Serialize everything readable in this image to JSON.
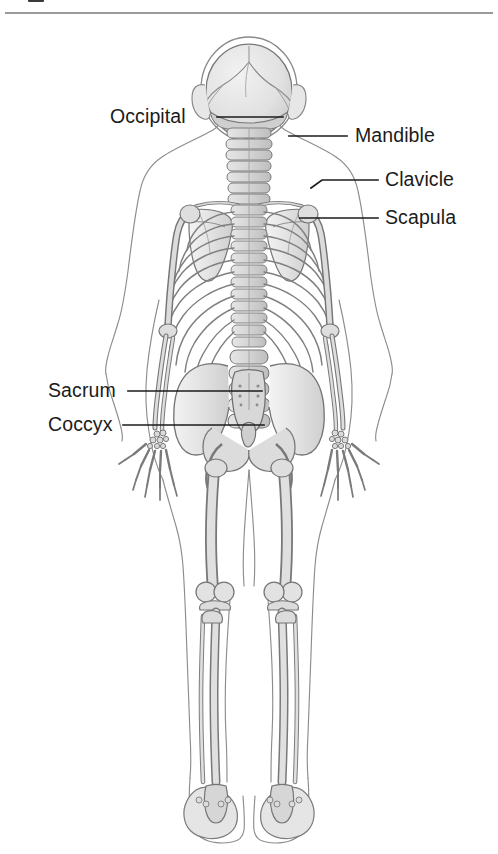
{
  "figure": {
    "title_fragment": "",
    "view": "posterior",
    "background_color": "#ffffff",
    "bone_fill_light": "#ebebeb",
    "bone_fill_mid": "#d2d2d2",
    "bone_fill_dark": "#bdbdbd",
    "outline_color": "#6e6e6e",
    "body_outline_color": "#8d8d8d",
    "label_color": "#1b1b1b",
    "leader_color": "#1b1b1b",
    "rule_color": "#9a9a9a"
  },
  "labels": [
    {
      "id": "occipital",
      "text": "Occipital",
      "side": "left",
      "x": 110,
      "y": 107,
      "leader_from_x": 217,
      "leader_from_y": 117,
      "leader_to_x": 283,
      "leader_to_y": 117
    },
    {
      "id": "mandible",
      "text": "Mandible",
      "side": "right",
      "x": 355,
      "y": 126,
      "leader_from_x": 347,
      "leader_from_y": 136,
      "leader_to_x": 289,
      "leader_to_y": 136
    },
    {
      "id": "clavicle",
      "text": "Clavicle",
      "side": "right",
      "x": 385,
      "y": 170,
      "leader_from_x": 378,
      "leader_from_y": 180,
      "leader_to_x": 318,
      "leader_to_y": 180
    },
    {
      "id": "scapula",
      "text": "Scapula",
      "side": "right",
      "x": 385,
      "y": 208,
      "leader_from_x": 378,
      "leader_from_y": 218,
      "leader_to_x": 318,
      "leader_to_y": 218
    },
    {
      "id": "sacrum",
      "text": "Sacrum",
      "side": "left",
      "x": 48,
      "y": 381,
      "leader_from_x": 128,
      "leader_from_y": 391,
      "leader_to_x": 262,
      "leader_to_y": 391
    },
    {
      "id": "coccyx",
      "text": "Coccyx",
      "side": "left",
      "x": 48,
      "y": 415,
      "leader_from_x": 123,
      "leader_from_y": 425,
      "leader_to_x": 264,
      "leader_to_y": 425
    }
  ],
  "regions": [
    {
      "id": "skull",
      "name": "Skull (occipital view)"
    },
    {
      "id": "cervical-spine",
      "name": "Cervical vertebrae"
    },
    {
      "id": "thoracic-spine",
      "name": "Thoracic vertebrae"
    },
    {
      "id": "lumbar-spine",
      "name": "Lumbar vertebrae"
    },
    {
      "id": "rib-cage",
      "name": "Rib cage"
    },
    {
      "id": "scapula-left",
      "name": "Left scapula"
    },
    {
      "id": "scapula-right",
      "name": "Right scapula"
    },
    {
      "id": "clavicle-left",
      "name": "Left clavicle"
    },
    {
      "id": "clavicle-right",
      "name": "Right clavicle"
    },
    {
      "id": "humerus-left",
      "name": "Left humerus"
    },
    {
      "id": "humerus-right",
      "name": "Right humerus"
    },
    {
      "id": "radius-ulna-left",
      "name": "Left radius and ulna"
    },
    {
      "id": "radius-ulna-right",
      "name": "Right radius and ulna"
    },
    {
      "id": "hand-left",
      "name": "Left hand"
    },
    {
      "id": "hand-right",
      "name": "Right hand"
    },
    {
      "id": "pelvis",
      "name": "Pelvis"
    },
    {
      "id": "sacrum-bone",
      "name": "Sacrum"
    },
    {
      "id": "coccyx-bone",
      "name": "Coccyx"
    },
    {
      "id": "femur-left",
      "name": "Left femur"
    },
    {
      "id": "femur-right",
      "name": "Right femur"
    },
    {
      "id": "knee-left",
      "name": "Left knee"
    },
    {
      "id": "knee-right",
      "name": "Right knee"
    },
    {
      "id": "tibia-fibula-left",
      "name": "Left tibia and fibula"
    },
    {
      "id": "tibia-fibula-right",
      "name": "Right tibia and fibula"
    },
    {
      "id": "foot-left",
      "name": "Left foot"
    },
    {
      "id": "foot-right",
      "name": "Right foot"
    }
  ]
}
